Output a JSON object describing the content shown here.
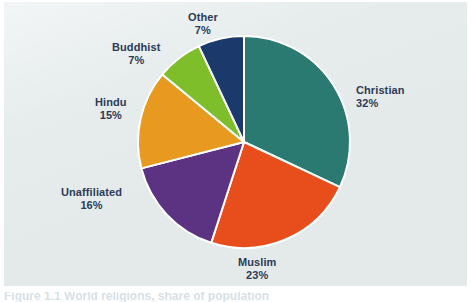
{
  "figure": {
    "caption": "Figure 1.1  World religions, share of population",
    "panel_color": "#e4eaea",
    "label_color": "#2d3b57",
    "separator_color": "#ffffff"
  },
  "chart_data": {
    "type": "pie",
    "title": "",
    "xlabel": "",
    "ylabel": "",
    "legend_position": "none",
    "grid": false,
    "start_angle_deg": 0,
    "direction": "clockwise",
    "value_unit": "%",
    "categories": [
      "Christian",
      "Muslim",
      "Unaffiliated",
      "Hindu",
      "Buddhist",
      "Other"
    ],
    "values": [
      32,
      23,
      16,
      15,
      7,
      7
    ],
    "colors": [
      "#2a7a72",
      "#e84e1b",
      "#5c3382",
      "#e8991f",
      "#7dbe2a",
      "#1b3a6b"
    ],
    "slices": [
      {
        "label": "Christian",
        "value": 32,
        "value_text": "32%",
        "color": "#2a7a72"
      },
      {
        "label": "Muslim",
        "value": 23,
        "value_text": "23%",
        "color": "#e84e1b"
      },
      {
        "label": "Unaffiliated",
        "value": 16,
        "value_text": "16%",
        "color": "#5c3382"
      },
      {
        "label": "Hindu",
        "value": 15,
        "value_text": "15%",
        "color": "#e8991f"
      },
      {
        "label": "Buddhist",
        "value": 7,
        "value_text": "7%",
        "color": "#7dbe2a"
      },
      {
        "label": "Other",
        "value": 7,
        "value_text": "7%",
        "color": "#1b3a6b"
      }
    ]
  }
}
